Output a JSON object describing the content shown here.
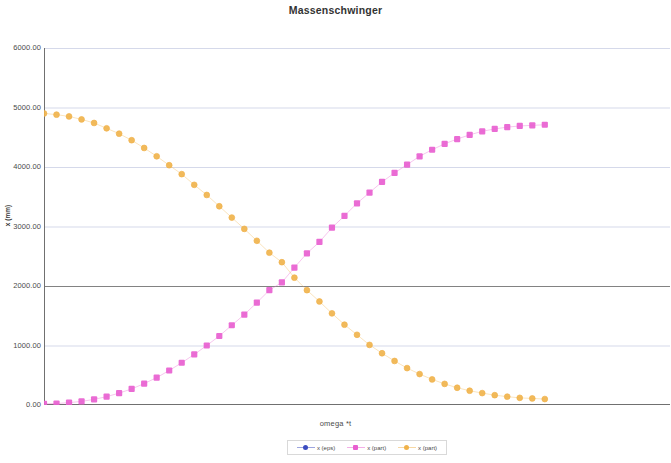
{
  "chart": {
    "title": "Massenschwinger",
    "xlabel": "omega *t",
    "ylabel": "x (mm)"
  },
  "yticks": [
    {
      "label": "6000.00",
      "value": 6000
    },
    {
      "label": "5000.00",
      "value": 5000
    },
    {
      "label": "4000.00",
      "value": 4000
    },
    {
      "label": "3000.00",
      "value": 3000
    },
    {
      "label": "2000.00",
      "value": 2000
    },
    {
      "label": "1000.00",
      "value": 1000
    },
    {
      "label": "0.00",
      "value": 0
    }
  ],
  "legend": [
    {
      "name": "x (eps)",
      "color": "#3b4cc0",
      "marker": "circle"
    },
    {
      "name": "x (part)",
      "color": "#e85fd0",
      "marker": "square"
    },
    {
      "name": "x (part)",
      "color": "#f0b24a",
      "marker": "circle"
    }
  ],
  "chart_data": {
    "type": "scatter",
    "title": "Massenschwinger",
    "xlabel": "omega *t",
    "ylabel": "x (mm)",
    "xlim": [
      0,
      50
    ],
    "ylim": [
      0,
      6000
    ],
    "ytick_values": [
      0,
      1000,
      2000,
      3000,
      4000,
      5000,
      6000
    ],
    "ytick_labels": [
      "0.00",
      "1000.00",
      "2000.00",
      "3000.00",
      "4000.00",
      "5000.00",
      "6000.00"
    ],
    "xtick_labels": [],
    "grid": true,
    "legend_position": "bottom",
    "series": [
      {
        "name": "x (eps)",
        "color": "#3b4cc0",
        "marker": "circle",
        "visible": false,
        "x": [],
        "values": []
      },
      {
        "name": "x (part)",
        "color": "#e85fd0",
        "marker": "square",
        "x": [
          0,
          1,
          2,
          3,
          4,
          5,
          6,
          7,
          8,
          9,
          10,
          11,
          12,
          13,
          14,
          15,
          16,
          17,
          18,
          19,
          20,
          21,
          22,
          23,
          24,
          25,
          26,
          27,
          28,
          29,
          30,
          31,
          32,
          33,
          34,
          35,
          36,
          37,
          38,
          39,
          40
        ],
        "values": [
          20,
          25,
          40,
          60,
          95,
          140,
          200,
          270,
          360,
          460,
          580,
          710,
          850,
          1000,
          1160,
          1340,
          1520,
          1720,
          1930,
          2060,
          2310,
          2550,
          2740,
          2980,
          3180,
          3390,
          3570,
          3750,
          3900,
          4040,
          4180,
          4290,
          4390,
          4470,
          4540,
          4600,
          4640,
          4670,
          4690,
          4700,
          4710
        ]
      },
      {
        "name": "x (part)",
        "color": "#f0b24a",
        "marker": "circle",
        "x": [
          0,
          1,
          2,
          3,
          4,
          5,
          6,
          7,
          8,
          9,
          10,
          11,
          12,
          13,
          14,
          15,
          16,
          17,
          18,
          19,
          20,
          21,
          22,
          23,
          24,
          25,
          26,
          27,
          28,
          29,
          30,
          31,
          32,
          33,
          34,
          35,
          36,
          37,
          38,
          39,
          40
        ],
        "values": [
          4900,
          4880,
          4850,
          4800,
          4740,
          4650,
          4560,
          4450,
          4320,
          4180,
          4030,
          3880,
          3700,
          3530,
          3340,
          3150,
          2960,
          2760,
          2560,
          2400,
          2140,
          1930,
          1740,
          1540,
          1350,
          1180,
          1010,
          870,
          740,
          620,
          520,
          430,
          355,
          290,
          240,
          200,
          165,
          140,
          120,
          110,
          100
        ]
      }
    ]
  },
  "style": {
    "grid_color": "#b9bfdc",
    "axis_color": "#707070",
    "plot_bg": "#ffffff"
  }
}
